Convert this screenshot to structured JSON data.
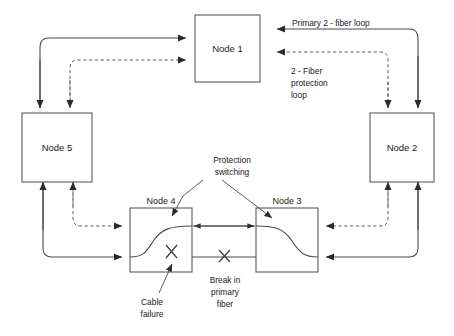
{
  "diagram": {
    "colors": {
      "line": "#4a4a4a",
      "dashed_line": "#5a5a5a",
      "text": "#1a1a1a",
      "background": "#ffffff"
    },
    "nodes": [
      {
        "id": "node1",
        "label": "Node 1",
        "label_position": "inside"
      },
      {
        "id": "node2",
        "label": "Node 2",
        "label_position": "inside"
      },
      {
        "id": "node3",
        "label": "Node 3",
        "label_position": "above"
      },
      {
        "id": "node4",
        "label": "Node 4",
        "label_position": "above"
      },
      {
        "id": "node5",
        "label": "Node 5",
        "label_position": "inside"
      }
    ],
    "annotations": {
      "primary_loop": "Primary 2 - fiber loop",
      "protection_loop_line1": "2 - Fiber",
      "protection_loop_line2": "protection",
      "protection_loop_line3": "loop",
      "protection_switching_line1": "Protection",
      "protection_switching_line2": "switching",
      "cable_failure_line1": "Cable",
      "cable_failure_line2": "failure",
      "break_line1": "Break in",
      "break_line2": "primary",
      "break_line3": "fiber"
    },
    "fault_markers": [
      {
        "id": "cable-failure-x",
        "symbol": "X"
      },
      {
        "id": "break-primary-x",
        "symbol": "X"
      }
    ]
  }
}
